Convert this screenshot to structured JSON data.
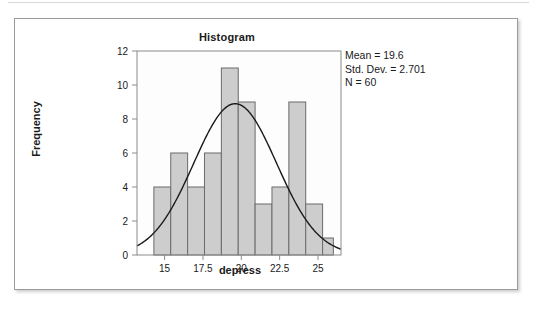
{
  "figure": {
    "title": "Histogram",
    "annotations": {
      "mean_label": "Mean = 19.6",
      "sd_label": "Std. Dev. = 2.701",
      "n_label": "N = 60"
    }
  },
  "chart_data": {
    "type": "bar",
    "title": "Histogram",
    "xlabel": "depress",
    "ylabel": "Frequency",
    "xlim": [
      13.2,
      26.5
    ],
    "ylim": [
      0,
      12
    ],
    "xticks": [
      "15",
      "17.5",
      "20",
      "22.5",
      "25"
    ],
    "xtick_values": [
      15,
      17.5,
      20,
      22.5,
      25
    ],
    "yticks": [
      "0",
      "2",
      "4",
      "6",
      "8",
      "10",
      "12"
    ],
    "ytick_values": [
      0,
      2,
      4,
      6,
      8,
      10,
      12
    ],
    "grid": false,
    "legend": "none",
    "bin_width": 1.1,
    "bin_starts": [
      14.3,
      15.4,
      16.5,
      17.6,
      18.7,
      19.8,
      20.9,
      22.0,
      23.1,
      24.2
    ],
    "bin_centers": [
      14.85,
      15.95,
      17.05,
      18.15,
      19.25,
      20.35,
      21.45,
      22.55,
      23.65,
      24.75
    ],
    "values": [
      4,
      6,
      4,
      6,
      11,
      9,
      3,
      4,
      9,
      3,
      1
    ],
    "bars": [
      {
        "x0": 14.3,
        "x1": 15.4,
        "height": 4
      },
      {
        "x0": 15.4,
        "x1": 16.5,
        "height": 6
      },
      {
        "x0": 16.5,
        "x1": 17.6,
        "height": 4
      },
      {
        "x0": 17.6,
        "x1": 18.7,
        "height": 6
      },
      {
        "x0": 18.7,
        "x1": 19.8,
        "height": 11
      },
      {
        "x0": 19.8,
        "x1": 20.9,
        "height": 9
      },
      {
        "x0": 20.9,
        "x1": 22.0,
        "height": 3
      },
      {
        "x0": 22.0,
        "x1": 23.1,
        "height": 4
      },
      {
        "x0": 23.1,
        "x1": 24.2,
        "height": 9
      },
      {
        "x0": 24.2,
        "x1": 25.3,
        "height": 3
      },
      {
        "x0": 25.3,
        "x1": 26.0,
        "height": 1
      }
    ],
    "normal_curve": {
      "mean": 19.6,
      "std_dev": 2.701,
      "n": 60,
      "peak_frequency": 8.9
    },
    "colors": {
      "bar_fill": "#cdcdcd",
      "bar_stroke": "#6b6b6b",
      "curve": "#1a1a1a",
      "axis": "#8c8c8c",
      "plot_background": "#fdfdfd",
      "text": "#1a1a1a"
    }
  }
}
